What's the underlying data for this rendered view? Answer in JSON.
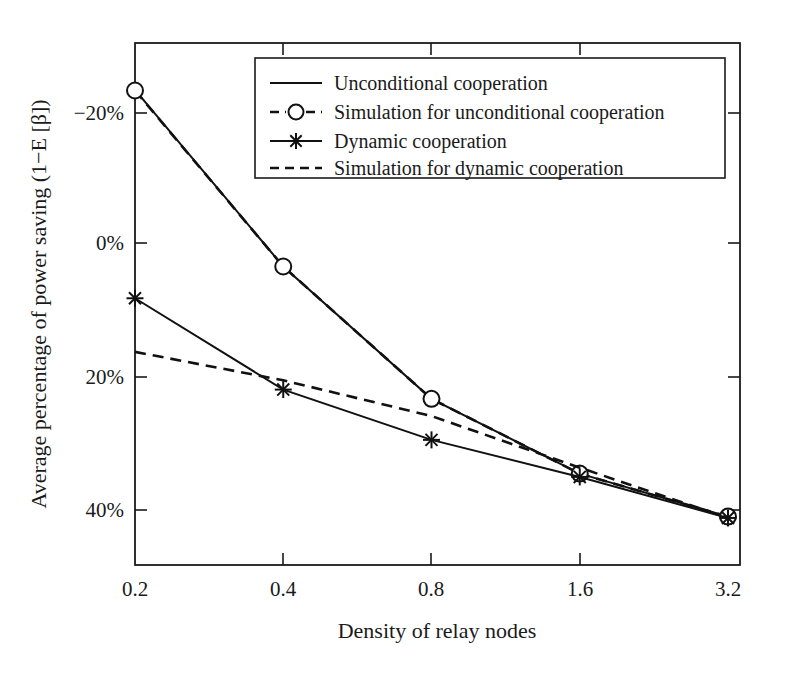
{
  "chart_data": {
    "type": "line",
    "title": "",
    "xlabel": "Density of relay nodes",
    "ylabel": "Average percentage of power saving (1−E [β])",
    "x": [
      0.2,
      0.4,
      0.8,
      1.6,
      3.2
    ],
    "xtick_labels": [
      "0.2",
      "0.4",
      "0.8",
      "1.6",
      "3.2"
    ],
    "x_scale": "log2",
    "ytick_labels": [
      "−20%",
      "0%",
      "20%",
      "40%"
    ],
    "ytick_values": [
      -20,
      0,
      20,
      40
    ],
    "ylim": [
      -24,
      47
    ],
    "y_axis_inverted": true,
    "grid": false,
    "legend_position": "top-right-inside",
    "series": [
      {
        "name": "Unconditional cooperation",
        "style": "solid",
        "marker": "none",
        "values": [
          -23.5,
          3.2,
          23.2,
          34.5,
          41.0
        ]
      },
      {
        "name": "Simulation for unconditional cooperation",
        "style": "dashed",
        "marker": "circle",
        "values": [
          -23.4,
          3.2,
          23.2,
          34.5,
          41.0
        ]
      },
      {
        "name": "Dynamic cooperation",
        "style": "solid",
        "marker": "star",
        "values": [
          8.0,
          21.8,
          29.4,
          35.0,
          41.2
        ]
      },
      {
        "name": "Simulation for dynamic cooperation",
        "style": "dashed",
        "marker": "none",
        "values": [
          16.1,
          20.4,
          25.8,
          33.6,
          41.2
        ]
      }
    ]
  },
  "legend": {
    "entries": [
      {
        "label": "Unconditional cooperation",
        "sample": "solid-line"
      },
      {
        "label": "Simulation for unconditional cooperation",
        "sample": "dashed-line-circle-marker"
      },
      {
        "label": "Dynamic cooperation",
        "sample": "solid-line-star-marker"
      },
      {
        "label": "Simulation for dynamic cooperation",
        "sample": "dashed-line"
      }
    ]
  },
  "axes": {
    "x_title": "Density of relay nodes",
    "y_title": "Average percentage of power saving (1−E [β])",
    "x_ticks": [
      "0.2",
      "0.4",
      "0.8",
      "1.6",
      "3.2"
    ],
    "y_ticks": [
      "−20%",
      "0%",
      "20%",
      "40%"
    ]
  },
  "colors": {
    "line": "#111111",
    "axis": "#1a1a1a",
    "background": "#ffffff",
    "marker_fill": "#ffffff"
  }
}
